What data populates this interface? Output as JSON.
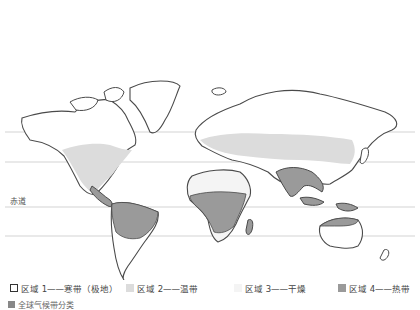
{
  "map": {
    "equator_label": "赤道",
    "colors": {
      "zone1": "#ffffff",
      "zone2": "#dcdcdc",
      "zone3": "#f4f4f4",
      "zone4": "#9a9a9a",
      "outline": "#4a4a4a",
      "latitude_line": "#c8c8c8"
    }
  },
  "legend": {
    "items": [
      {
        "label": "区域 1——寒带（极地）",
        "swatch": "zone1"
      },
      {
        "label": "区域 2——温带",
        "swatch": "zone2"
      },
      {
        "label": "区域 3——干燥",
        "swatch": "zone3"
      },
      {
        "label": "区域 4——热带",
        "swatch": "zone4"
      }
    ]
  },
  "caption": {
    "text": "全球气候带分类"
  }
}
